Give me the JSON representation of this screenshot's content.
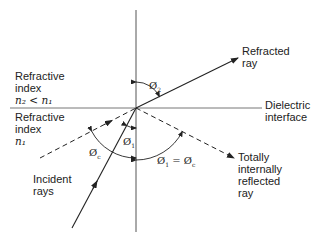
{
  "diagram": {
    "labels": {
      "upper_medium": {
        "line1": "Refractive",
        "line2": "index",
        "line3": "n₂ < n₁"
      },
      "lower_medium": {
        "line1": "Refractive",
        "line2": "index",
        "line3": "n₁"
      },
      "refracted_ray": {
        "line1": "Refracted",
        "line2": "ray"
      },
      "interface": {
        "line1": "Dielectric",
        "line2": "interface"
      },
      "incident_rays": {
        "line1": "Incident",
        "line2": "rays"
      },
      "reflected_ray": {
        "line1": "Totally",
        "line2": "internally",
        "line3": "reflected",
        "line4": "ray"
      }
    },
    "angles": {
      "phi2": {
        "symbol": "Ø",
        "sub": "2"
      },
      "phi1": {
        "symbol": "Ø",
        "sub": "1"
      },
      "phic": {
        "symbol": "Ø",
        "sub": "c"
      },
      "phi1_eq_phic": {
        "left": "Ø",
        "left_sub": "1",
        "eq": " = ",
        "right": "Ø",
        "right_sub": "c"
      }
    },
    "geometry": {
      "origin": [
        136,
        108
      ],
      "normal": {
        "x": 136,
        "y1": 10,
        "y2": 232
      },
      "interface": {
        "y": 108,
        "x1": 10,
        "x2": 262
      },
      "refracted_ray": {
        "from": [
          136,
          108
        ],
        "to": [
          238,
          58
        ]
      },
      "incident_ray": {
        "from": [
          72,
          228
        ],
        "to": [
          136,
          108
        ]
      },
      "critical_incident_ray": {
        "from": [
          40,
          158
        ],
        "to": [
          136,
          108
        ],
        "style": "dashed"
      },
      "reflected_ray": {
        "from": [
          136,
          108
        ],
        "to": [
          234,
          158
        ],
        "style": "dashed"
      }
    },
    "colors": {
      "line": "#333333",
      "text": "#222222",
      "background": "#ffffff"
    }
  }
}
